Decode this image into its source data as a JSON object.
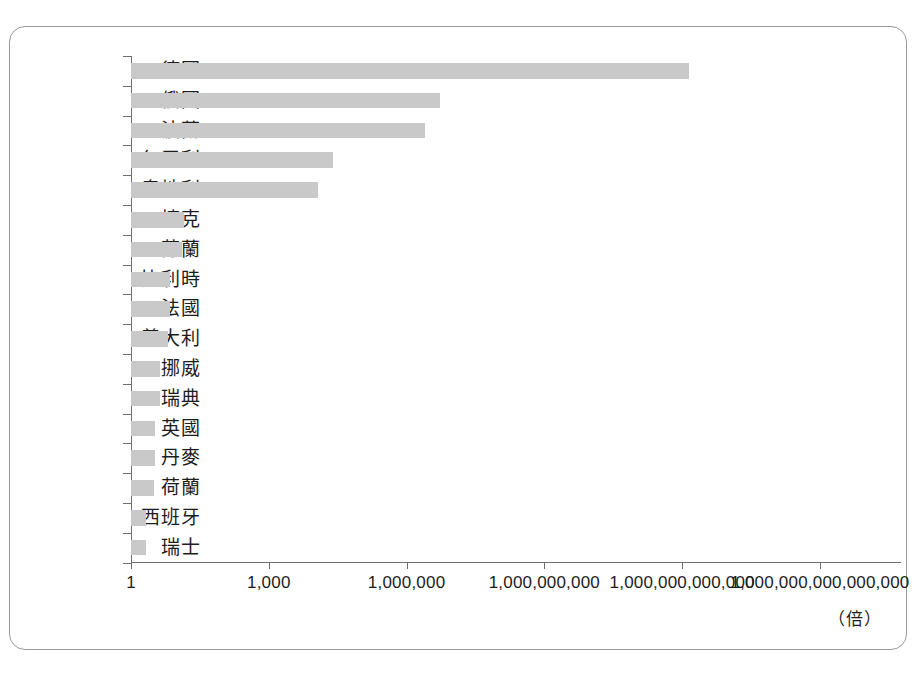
{
  "figure": {
    "unit_label": "（倍）",
    "bar_color": "#c9c9c9",
    "axis_color": "#6f6f6f",
    "border_color": "#9a9a9a",
    "top_cropped_text": "",
    "bottom_cropped_text": ""
  },
  "chart_data": {
    "type": "bar",
    "orientation": "horizontal",
    "title": "",
    "xlabel": "（倍）",
    "ylabel": "",
    "xscale": "log",
    "xlim": [
      1,
      1000000000000000.0
    ],
    "grid": false,
    "legend": null,
    "xtick_labels": [
      "1",
      "1,000",
      "1,000,000",
      "1,000,000,000",
      "1,000,000,000,000",
      "1,000,000,000,000,000"
    ],
    "xtick_values": [
      1,
      1000,
      1000000,
      1000000000,
      1000000000000,
      1000000000000000
    ],
    "categories": [
      "德國",
      "俄國",
      "波蘭",
      "匈牙利",
      "奧地利",
      "捷克",
      "芬蘭",
      "比利時",
      "法國",
      "義大利",
      "挪威",
      "瑞典",
      "英國",
      "丹麥",
      "荷蘭",
      "西班牙",
      "瑞士"
    ],
    "values": [
      1400000000000.0,
      5000000.0,
      2500000.0,
      25000.0,
      12000.0,
      14,
      13,
      7.0,
      7.0,
      6.5,
      4.2,
      4.2,
      3.3,
      3.3,
      3.2,
      2.1,
      2.1
    ],
    "log10_values": [
      12.15,
      6.73,
      6.4,
      4.4,
      4.08,
      1.15,
      1.11,
      0.85,
      0.85,
      0.81,
      0.63,
      0.63,
      0.52,
      0.52,
      0.51,
      0.33,
      0.33
    ]
  }
}
